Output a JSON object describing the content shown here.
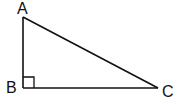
{
  "diagram": {
    "type": "right-triangle",
    "vertices": [
      {
        "label": "A",
        "x": 23,
        "y": 17
      },
      {
        "label": "B",
        "x": 23,
        "y": 88
      },
      {
        "label": "C",
        "x": 158,
        "y": 88
      }
    ],
    "right_angle_at": "B",
    "labels": {
      "a": "A",
      "b": "B",
      "c": "C"
    },
    "stroke_color": "#111111",
    "background": "#ffffff"
  }
}
